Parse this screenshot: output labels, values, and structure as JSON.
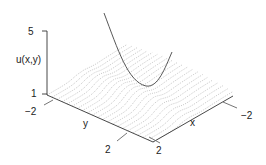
{
  "chart_data": {
    "type": "surface3d",
    "title": "",
    "zlabel": "u(x,y)",
    "xlabel": "x",
    "ylabel": "y",
    "z_ticks": [
      "5",
      "1"
    ],
    "x_ticks": [
      "2",
      "-2"
    ],
    "y_ticks": [
      "-2",
      "2"
    ],
    "zlim": [
      1,
      5
    ],
    "xlim": [
      -2,
      2
    ],
    "ylim": [
      -2,
      2
    ],
    "surface_style": "dotted grey contour lines",
    "overlay_curve": "parabolic curve (solid dark line) rising above surface, minimum near surface center",
    "grid": false
  },
  "labels": {
    "z_tick_top": "5",
    "z_tick_bottom": "1",
    "z_axis_label": "u(x,y)",
    "y_tick_left": "−2",
    "y_tick_right": "2",
    "y_axis_label": "y",
    "x_tick_left": "2",
    "x_tick_right": "−2",
    "x_axis_label": "x"
  },
  "colors": {
    "axis": "#333333",
    "surface_lines": "#9a9a9a",
    "curve": "#444444"
  }
}
